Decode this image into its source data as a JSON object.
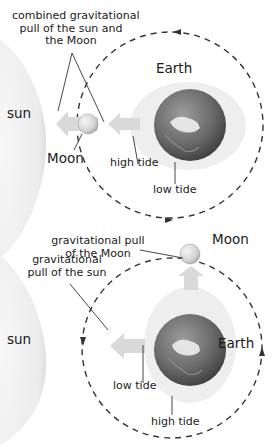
{
  "colors": {
    "background": "#ffffff",
    "sun_fill": "#ececec",
    "tidal_bulge": "#ededed",
    "arrow_fill": "#d9d9d9",
    "orbit_line": "#333333",
    "leader_line": "#333333",
    "earth_dark": "#4a4a4a",
    "earth_light": "#9a9a9a",
    "moon_fill": "#dcdcdc",
    "text": "#1a1a1a"
  },
  "top_diagram": {
    "title_label": "combined gravitational pull of the sun and the Moon",
    "title_lines": [
      "combined gravitational",
      "pull of the sun and",
      "the Moon"
    ],
    "sun_label": "sun",
    "moon_label": "Moon",
    "earth_label": "Earth",
    "high_tide_label": "high tide",
    "low_tide_label": "low tide",
    "orbit_direction": "counterclockwise"
  },
  "bottom_diagram": {
    "moon_pull_label": "gravitational pull of the Moon",
    "moon_pull_lines": [
      "gravitational pull",
      "of the Moon"
    ],
    "sun_pull_label": "gravitational pull of the sun",
    "sun_pull_lines": [
      "gravitational",
      "pull of the sun"
    ],
    "sun_label": "sun",
    "moon_label": "Moon",
    "earth_label": "Earth",
    "low_tide_label": "low tide",
    "high_tide_label": "high tide",
    "orbit_direction": "counterclockwise"
  }
}
